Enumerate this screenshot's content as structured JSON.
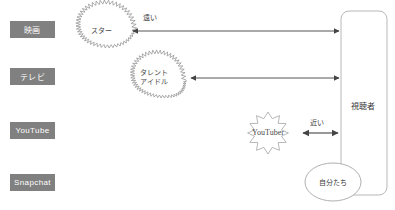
{
  "diagram": {
    "colors": {
      "box_fill": "#808080",
      "box_text": "#ffffff",
      "line": "#555555",
      "burst_stroke": "#8a8a8a",
      "panel_stroke": "#b8b8b8",
      "text": "#3a3a3a"
    },
    "platforms": [
      {
        "label": "映画"
      },
      {
        "label": "テレビ"
      },
      {
        "label": "YouTube"
      },
      {
        "label": "Snapchat"
      }
    ],
    "bursts": [
      {
        "label": "スター",
        "style": "dense-jagged"
      },
      {
        "label": "タレント\nアイドル",
        "style": "dense-jagged"
      },
      {
        "label": "YouTuber",
        "style": "spiky-star"
      }
    ],
    "distance_labels": [
      {
        "label": "遠い"
      },
      {
        "label": "近い"
      }
    ],
    "audience_panel": {
      "label": "視聴者"
    },
    "self_circle": {
      "label": "自分たち"
    }
  }
}
